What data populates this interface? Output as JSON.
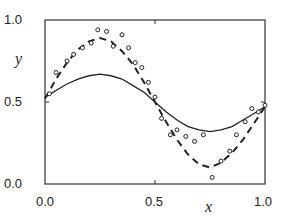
{
  "chart_data": {
    "type": "line",
    "title": "",
    "xlabel": "x",
    "ylabel": "y",
    "xlim": [
      0.0,
      1.0
    ],
    "ylim": [
      0.0,
      1.0
    ],
    "xticks": [
      "0.0",
      "0.5",
      "1.0"
    ],
    "yticks": [
      "0.0",
      "0.5",
      "1.0"
    ],
    "grid": false,
    "legend": null,
    "series": [
      {
        "name": "solid-curve",
        "style": "solid",
        "x": [
          0.0,
          0.05,
          0.1,
          0.15,
          0.2,
          0.25,
          0.3,
          0.35,
          0.4,
          0.45,
          0.5,
          0.55,
          0.6,
          0.65,
          0.7,
          0.75,
          0.8,
          0.85,
          0.9,
          0.95,
          1.0
        ],
        "y": [
          0.53,
          0.57,
          0.61,
          0.64,
          0.66,
          0.67,
          0.66,
          0.64,
          0.6,
          0.56,
          0.5,
          0.44,
          0.39,
          0.35,
          0.33,
          0.32,
          0.33,
          0.35,
          0.39,
          0.43,
          0.47
        ]
      },
      {
        "name": "dashed-curve",
        "style": "dashed",
        "x": [
          0.0,
          0.05,
          0.1,
          0.15,
          0.2,
          0.25,
          0.3,
          0.35,
          0.4,
          0.45,
          0.5,
          0.55,
          0.6,
          0.65,
          0.7,
          0.75,
          0.8,
          0.85,
          0.9,
          0.95,
          1.0
        ],
        "y": [
          0.52,
          0.64,
          0.74,
          0.82,
          0.87,
          0.89,
          0.87,
          0.81,
          0.73,
          0.62,
          0.5,
          0.38,
          0.27,
          0.18,
          0.12,
          0.1,
          0.13,
          0.19,
          0.27,
          0.37,
          0.47
        ]
      },
      {
        "name": "data-points",
        "style": "markers",
        "x": [
          0.02,
          0.05,
          0.1,
          0.13,
          0.17,
          0.21,
          0.24,
          0.28,
          0.31,
          0.35,
          0.38,
          0.41,
          0.44,
          0.47,
          0.5,
          0.53,
          0.57,
          0.6,
          0.64,
          0.68,
          0.72,
          0.76,
          0.8,
          0.84,
          0.87,
          0.91,
          0.94,
          0.97,
          1.0
        ],
        "y": [
          0.55,
          0.68,
          0.75,
          0.79,
          0.83,
          0.86,
          0.94,
          0.93,
          0.84,
          0.91,
          0.83,
          0.74,
          0.71,
          0.62,
          0.53,
          0.4,
          0.3,
          0.33,
          0.29,
          0.26,
          0.3,
          0.04,
          0.14,
          0.2,
          0.3,
          0.38,
          0.46,
          0.44,
          0.48
        ]
      }
    ]
  }
}
